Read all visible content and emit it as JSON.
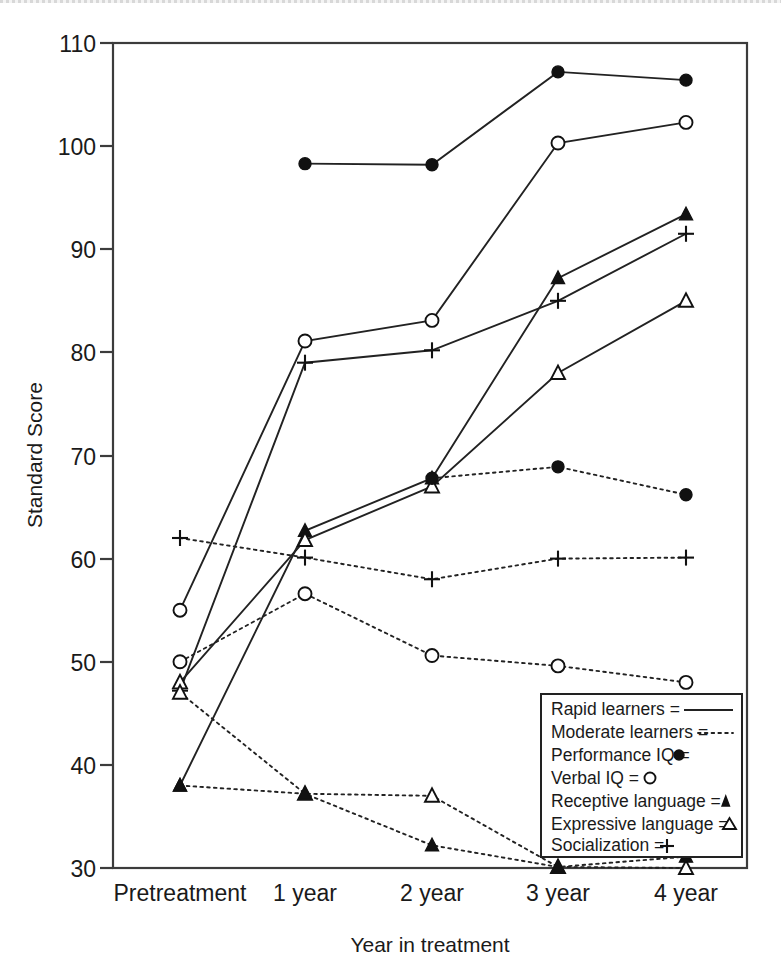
{
  "chart_data": {
    "type": "line",
    "title": "",
    "xlabel": "Year in treatment",
    "ylabel": "Standard Score",
    "categories": [
      "Pretreatment",
      "1 year",
      "2 year",
      "3 year",
      "4 year"
    ],
    "xtick_labels": [
      "Pretreatment",
      "1 year",
      "2 year",
      "3 year",
      "4 year"
    ],
    "ytick_labels": [
      "30",
      "40",
      "50",
      "60",
      "70",
      "80",
      "90",
      "100",
      "110"
    ],
    "yticks": [
      30,
      40,
      50,
      60,
      70,
      80,
      90,
      100,
      110
    ],
    "ylim": [
      30,
      110
    ],
    "grid": false,
    "legend_position": "lower-right",
    "legend_entries": [
      {
        "label": "Rapid learners",
        "equals": "=",
        "sample": "solid-line"
      },
      {
        "label": "Moderate learners",
        "equals": "=",
        "sample": "dotted-line"
      },
      {
        "label": "Performance IQ",
        "equals": "=",
        "sample": "filled-circle"
      },
      {
        "label": "Verbal IQ",
        "equals": "=",
        "sample": "open-circle"
      },
      {
        "label": "Receptive language",
        "equals": "=",
        "sample": "filled-triangle"
      },
      {
        "label": "Expressive language",
        "equals": "=",
        "sample": "open-triangle"
      },
      {
        "label": "Socialization",
        "equals": "=",
        "sample": "plus"
      }
    ],
    "series": [
      {
        "name": "Rapid learners – Performance IQ",
        "group": "Rapid learners",
        "measure": "Performance IQ",
        "style": "solid",
        "marker": "filled-circle",
        "x": [
          "1 year",
          "2 year",
          "3 year",
          "4 year"
        ],
        "values": [
          98.3,
          98.2,
          107.2,
          106.4
        ]
      },
      {
        "name": "Rapid learners – Verbal IQ",
        "group": "Rapid learners",
        "measure": "Verbal IQ",
        "style": "solid",
        "marker": "open-circle",
        "x": [
          "Pretreatment",
          "1 year",
          "2 year",
          "3 year",
          "4 year"
        ],
        "values": [
          55.0,
          81.1,
          83.1,
          100.3,
          102.3
        ]
      },
      {
        "name": "Rapid learners – Socialization",
        "group": "Rapid learners",
        "measure": "Socialization",
        "style": "solid",
        "marker": "plus",
        "x": [
          "Pretreatment",
          "1 year",
          "2 year",
          "3 year",
          "4 year"
        ],
        "values": [
          47.2,
          79.0,
          80.2,
          85.0,
          91.5
        ]
      },
      {
        "name": "Rapid learners – Receptive language",
        "group": "Rapid learners",
        "measure": "Receptive language",
        "style": "solid",
        "marker": "filled-triangle",
        "x": [
          "Pretreatment",
          "1 year",
          "2 year",
          "3 year",
          "4 year"
        ],
        "values": [
          38.0,
          62.7,
          67.8,
          87.2,
          93.4
        ]
      },
      {
        "name": "Rapid learners – Expressive language",
        "group": "Rapid learners",
        "measure": "Expressive language",
        "style": "solid",
        "marker": "open-triangle",
        "x": [
          "Pretreatment",
          "1 year",
          "2 year",
          "3 year",
          "4 year"
        ],
        "values": [
          48.0,
          61.8,
          67.0,
          78.0,
          85.0
        ]
      },
      {
        "name": "Moderate learners – Performance IQ",
        "group": "Moderate learners",
        "measure": "Performance IQ",
        "style": "dotted",
        "marker": "filled-circle",
        "x": [
          "2 year",
          "3 year",
          "4 year"
        ],
        "values": [
          67.8,
          68.9,
          66.2
        ]
      },
      {
        "name": "Moderate learners – Socialization",
        "group": "Moderate learners",
        "measure": "Socialization",
        "style": "dotted",
        "marker": "plus",
        "x": [
          "Pretreatment",
          "1 year",
          "2 year",
          "3 year",
          "4 year"
        ],
        "values": [
          62.0,
          60.1,
          58.0,
          60.0,
          60.1
        ]
      },
      {
        "name": "Moderate learners – Verbal IQ",
        "group": "Moderate learners",
        "measure": "Verbal IQ",
        "style": "dotted",
        "marker": "open-circle",
        "x": [
          "Pretreatment",
          "1 year",
          "2 year",
          "3 year",
          "4 year"
        ],
        "values": [
          50.0,
          56.6,
          50.6,
          49.6,
          48.0
        ]
      },
      {
        "name": "Moderate learners – Expressive language",
        "group": "Moderate learners",
        "measure": "Expressive language",
        "style": "dotted",
        "marker": "open-triangle",
        "x": [
          "Pretreatment",
          "1 year",
          "2 year",
          "3 year",
          "4 year"
        ],
        "values": [
          47.0,
          37.2,
          37.0,
          30.1,
          30.0
        ]
      },
      {
        "name": "Moderate learners – Receptive language",
        "group": "Moderate learners",
        "measure": "Receptive language",
        "style": "dotted",
        "marker": "filled-triangle",
        "x": [
          "Pretreatment",
          "1 year",
          "2 year",
          "3 year",
          "4 year"
        ],
        "values": [
          38.0,
          37.2,
          32.2,
          30.1,
          31.1
        ]
      }
    ]
  },
  "labels": {
    "ylabel": "Standard Score",
    "xlabel": "Year in treatment",
    "y_ticks": [
      "110",
      "100",
      "90",
      "80",
      "70",
      "60",
      "50",
      "40",
      "30"
    ],
    "x_ticks": [
      "Pretreatment",
      "1 year",
      "2 year",
      "3 year",
      "4 year"
    ]
  },
  "legend": {
    "rows": [
      "Rapid learners  =",
      "Moderate learners  =",
      "Performance IQ  =",
      "Verbal IQ  =",
      "Receptive language  =",
      "Expressive language  =",
      "Socialization  ="
    ]
  },
  "colors": {
    "ink": "#1a1a1a",
    "line": "#222222",
    "frame": "#3c3c3c",
    "paper": "#ffffff"
  }
}
